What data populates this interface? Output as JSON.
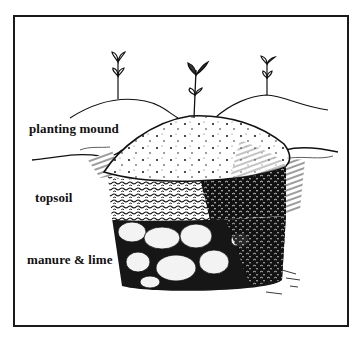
{
  "figure": {
    "labels": {
      "planting_mound": "planting mound",
      "topsoil": "topsoil",
      "manure_lime": "manure & lime"
    },
    "plants": [
      {
        "name": "left seedling",
        "position": "left hill"
      },
      {
        "name": "center seedling",
        "position": "top of planting mound"
      },
      {
        "name": "right seedling",
        "position": "right hill"
      }
    ],
    "layers": [
      "planting mound",
      "topsoil",
      "manure & lime"
    ],
    "colors": {
      "ink": "#111111",
      "paper": "#ffffff",
      "frame": "#1a1a1a"
    }
  }
}
